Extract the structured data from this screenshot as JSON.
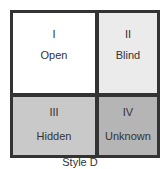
{
  "diagram": {
    "type": "johari-window",
    "quadrants": [
      {
        "numeral": "I",
        "label": "Open",
        "fill": "#ffffff"
      },
      {
        "numeral": "II",
        "label": "Blind",
        "fill": "#ebebeb"
      },
      {
        "numeral": "III",
        "label": "Hidden",
        "fill": "#c9c9c9"
      },
      {
        "numeral": "IV",
        "label": "Unknown",
        "fill": "#b5b5b5"
      }
    ],
    "border_color": "#333333",
    "caption": "Style D"
  }
}
